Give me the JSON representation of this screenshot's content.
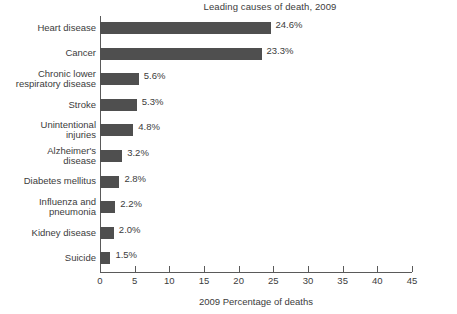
{
  "chart_data": {
    "type": "bar",
    "orientation": "horizontal",
    "title": "Leading causes of death, 2009",
    "xlabel": "2009 Percentage of deaths",
    "ylabel": "",
    "xlim": [
      0,
      45
    ],
    "xticks": [
      0,
      5,
      10,
      15,
      20,
      25,
      30,
      35,
      40,
      45
    ],
    "xtick_labels": [
      "0",
      "5",
      "10",
      "15",
      "20",
      "25",
      "30",
      "35",
      "40",
      "45"
    ],
    "grid": false,
    "legend": null,
    "bar_color": "#4f4f4f",
    "axis_color": "#5a5a5a",
    "text_color": "#3c3c3c",
    "categories": [
      "Heart disease",
      "Chronic lower respiratory disease",
      "Cancer",
      "Stroke",
      "Unintentional injuries",
      "Alzheimer's disease",
      "Diabetes mellitus",
      "Influenza and pneumonia",
      "Kidney disease",
      "Suicide"
    ],
    "values": [
      24.6,
      23.3,
      5.6,
      5.3,
      4.8,
      3.2,
      2.8,
      2.2,
      2.0,
      1.5
    ],
    "bars": [
      {
        "label_lines": [
          "Heart disease"
        ],
        "value": 24.6,
        "value_label": "24.6%"
      },
      {
        "label_lines": [
          "Cancer"
        ],
        "value": 23.3,
        "value_label": "23.3%"
      },
      {
        "label_lines": [
          "Chronic lower",
          "respiratory disease"
        ],
        "value": 5.6,
        "value_label": "5.6%"
      },
      {
        "label_lines": [
          "Stroke"
        ],
        "value": 5.3,
        "value_label": "5.3%"
      },
      {
        "label_lines": [
          "Unintentional",
          "injuries"
        ],
        "value": 4.8,
        "value_label": "4.8%"
      },
      {
        "label_lines": [
          "Alzheimer's",
          "disease"
        ],
        "value": 3.2,
        "value_label": "3.2%"
      },
      {
        "label_lines": [
          "Diabetes mellitus"
        ],
        "value": 2.8,
        "value_label": "2.8%"
      },
      {
        "label_lines": [
          "Influenza and",
          "pneumonia"
        ],
        "value": 2.2,
        "value_label": "2.2%"
      },
      {
        "label_lines": [
          "Kidney disease"
        ],
        "value": 2.0,
        "value_label": "2.0%"
      },
      {
        "label_lines": [
          "Suicide"
        ],
        "value": 1.5,
        "value_label": "1.5%"
      }
    ]
  }
}
